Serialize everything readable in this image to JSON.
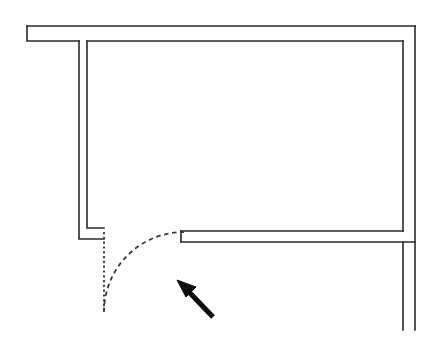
{
  "figure": {
    "kind": "architectural-floor-plan",
    "title": "",
    "background_color": "#ffffff",
    "canvas": {
      "width": 443,
      "height": 341
    }
  },
  "colors": {
    "wall_stroke": "#2a2a2a",
    "door_leaf_stroke": "#4a4a4a",
    "swing_arc_stroke": "#3a3a3a",
    "pointer_fill": "#0d0d0d"
  },
  "geometry": {
    "walls": {
      "top_wall_outer": "M 27 26 L 415 26",
      "top_wall_inner_left_stub": "M 27 26 L 27 41 L 79 41",
      "left_wall_outer": "M 79 41 L 79 239 L 104 239",
      "room_inner_outline": "M 87 41 L 87 228 L 104 228",
      "top_inner_horizontal": "M 87 41 L 403 41",
      "right_wall_inner": "M 403 41 L 403 231",
      "right_wall_outer": "M 415 26 L 415 330",
      "lower_partition_top": "M 181 231 L 403 231",
      "lower_partition_bottom": "M 181 242 L 415 242",
      "lower_partition_jamb": "M 181 231 L 181 242",
      "corridor_inner_vertical": "M 403 242 L 403 330"
    },
    "door_leaf": {
      "description": "door panel shown in open position, drawn as dotted vertical line",
      "path": "M 104 232 L 104 312",
      "hinge_point": {
        "x": 104,
        "y": 232
      },
      "free_edge_point": {
        "x": 104,
        "y": 312
      }
    },
    "swing_arc": {
      "description": "dashed quarter-circle showing door swing path",
      "center": {
        "x": 104,
        "y": 232
      },
      "radius": 80,
      "start_point": {
        "x": 104,
        "y": 312
      },
      "end_point": {
        "x": 184,
        "y": 232
      },
      "path": "M 104 312 A 80 80 0 0 1 184 232",
      "sweep_degrees": 90
    },
    "pointer": {
      "description": "black annotation arrow pointing up-left at the door swing arc",
      "tip": {
        "x": 177,
        "y": 280
      },
      "tail": {
        "x": 216,
        "y": 320
      },
      "shaft_path": "M 213 317 L 190 293",
      "head_points": "177,280 196,287 186,297"
    }
  },
  "labels": {
    "annotations": []
  }
}
